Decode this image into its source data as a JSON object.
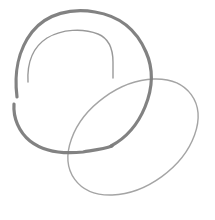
{
  "canvas": {
    "width": 215,
    "height": 220,
    "background_color": "#ffffff",
    "title": "Hand-drawn interlocking loops sketch",
    "medium": "pencil / pen line drawing",
    "stroke_count": 3
  },
  "palette": {
    "thick_stroke_color": "#7b7b7b",
    "thin_stroke_color": "#8e8e8e",
    "faint_stroke_color": "#9a9a9a",
    "background_color": "#ffffff"
  },
  "strokes": [
    {
      "id": "outer-thick-loop",
      "name": "outer thick loop",
      "description": "Large heavy rounded loop occupying the upper-left of the frame, open on the left side where a short gap interrupts the line. It sweeps up over the top, down the right side crossing the oval, and curves back along the bottom.",
      "stroke_color": "#7b7b7b",
      "stroke_width": 3.2,
      "opacity": 0.95,
      "closed": false,
      "bbox": [
        8,
        10,
        152,
        152
      ],
      "gap": {
        "present": true,
        "location": "left side",
        "at_y": 88
      },
      "path_upper": "M 17 97 C 14 74 18 50 32 32 C 47 13 72 8 95 12 C 120 16 137 31 146 52 C 154 70 152 90 145 107 C 138 124 126 138 111 146",
      "path_lower": "M 14 104 C 13 118 19 132 30 141 C 44 152 64 154 83 152 C 95 150 104 149 112 146"
    },
    {
      "id": "inner-thin-arc",
      "name": "inner thin arc",
      "description": "Thinner arc nested inside the thick loop, starting low on the left around y=82, arcing up and over the top and descending on the right to terminate near the oval's upper-left edge.",
      "stroke_color": "#8e8e8e",
      "stroke_width": 1.4,
      "opacity": 0.9,
      "closed": false,
      "bbox": [
        26,
        30,
        88,
        48
      ],
      "path": "M 28 82 C 27 63 33 47 47 38 C 62 29 83 28 98 34 C 110 39 113 50 113 62 C 113 68 113 73 113 78"
    },
    {
      "id": "tilted-oval",
      "name": "tilted oval",
      "description": "Thin closed ellipse tilted roughly 35 degrees clockwise, occupying the lower-right of the frame and overlapping the thick loop near its right and bottom edges.",
      "stroke_color": "#9a9a9a",
      "stroke_width": 1.4,
      "opacity": 0.9,
      "closed": true,
      "bbox": [
        62,
        71,
        141,
        132
      ],
      "rotation_deg": -36,
      "center": [
        133,
        137
      ],
      "radius_x": 72,
      "radius_y": 49
    }
  ],
  "intersections": [
    {
      "name": "thick-loop-crosses-oval-top",
      "x": 140,
      "y": 75
    },
    {
      "name": "thick-loop-crosses-oval-left",
      "x": 70,
      "y": 146
    },
    {
      "name": "inner-arc-meets-oval",
      "x": 113,
      "y": 77
    }
  ]
}
